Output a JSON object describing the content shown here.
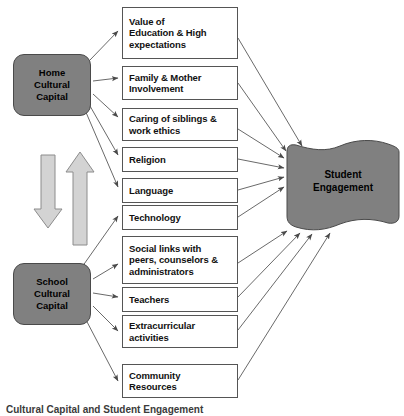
{
  "figure": {
    "caption": "Cultural Capital and Student Engagement"
  },
  "nodes": {
    "home": {
      "label": "Home\nCultural\nCapital",
      "line1": "Home",
      "line2": "Cultural",
      "line3": "Capital",
      "fill": "#808080"
    },
    "school": {
      "label": "School\nCultural\nCapital",
      "line1": "School",
      "line2": "Cultural",
      "line3": "Capital",
      "fill": "#808080"
    },
    "engagement": {
      "line1": "Student",
      "line2": "Engagement",
      "fill": "#808080"
    }
  },
  "factors": [
    {
      "id": "value-of-education",
      "line1": "Value of",
      "line2": "Education & High",
      "line3": "expectations",
      "source": "home"
    },
    {
      "id": "family-mother-involvement",
      "line1": "Family & Mother",
      "line2": "Involvement",
      "source": "home"
    },
    {
      "id": "caring-of-siblings",
      "line1": "Caring of siblings &",
      "line2": "work ethics",
      "source": "home"
    },
    {
      "id": "religion",
      "line1": "Religion",
      "source": "home"
    },
    {
      "id": "language",
      "line1": "Language",
      "source": "home"
    },
    {
      "id": "technology",
      "line1": "Technology",
      "source": "school"
    },
    {
      "id": "social-links",
      "line1": "Social links with",
      "line2": "peers, counselors &",
      "line3": "administrators",
      "source": "school"
    },
    {
      "id": "teachers",
      "line1": "Teachers",
      "source": "school"
    },
    {
      "id": "extracurricular-activities",
      "line1": "Extracurricular",
      "line2": "activities",
      "source": "school"
    },
    {
      "id": "community-resources",
      "line1": "Community",
      "line2": "Resources",
      "source": "school"
    }
  ],
  "block_arrows": {
    "down": {
      "name": "home-to-school-block-arrow",
      "direction": "down",
      "fill": "#d3d3d3"
    },
    "up": {
      "name": "school-to-home-block-arrow",
      "direction": "up",
      "fill": "#d3d3d3"
    }
  },
  "colors": {
    "node_fill": "#808080",
    "node_stroke": "#4a4a4a",
    "box_stroke": "#555555",
    "connector": "#6a6a6a",
    "block_arrow_fill": "#d3d3d3",
    "block_arrow_stroke": "#8c8c8c",
    "background": "#ffffff"
  }
}
